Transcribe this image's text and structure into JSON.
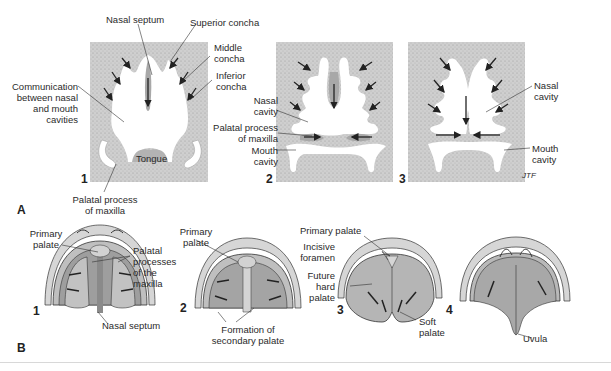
{
  "figure": {
    "part_a": {
      "label": "A",
      "panels": [
        {
          "number": "1",
          "labels": {
            "nasal_septum": "Nasal septum",
            "superior_concha": "Superior concha",
            "middle_concha_1": "Middle",
            "middle_concha_2": "concha",
            "inferior_concha_1": "Inferior",
            "inferior_concha_2": "concha",
            "communication_1": "Communication",
            "communication_2": "between nasal",
            "communication_3": "and mouth",
            "communication_4": "cavities",
            "tongue": "Tongue",
            "palatal_process_1": "Palatal process",
            "palatal_process_2": "of maxilla"
          }
        },
        {
          "number": "2",
          "labels": {
            "nasal_cavity_1": "Nasal",
            "nasal_cavity_2": "cavity",
            "palatal_process_1": "Palatal process",
            "palatal_process_2": "of maxilla",
            "mouth_cavity_1": "Mouth",
            "mouth_cavity_2": "cavity"
          }
        },
        {
          "number": "3",
          "labels": {
            "nasal_cavity_1": "Nasal",
            "nasal_cavity_2": "cavity",
            "mouth_cavity_1": "Mouth",
            "mouth_cavity_2": "cavity",
            "signature": "JTF"
          }
        }
      ]
    },
    "part_b": {
      "label": "B",
      "panels": [
        {
          "number": "1",
          "labels": {
            "primary_palate_1": "Primary",
            "primary_palate_2": "palate",
            "palatal_processes_1": "Palatal",
            "palatal_processes_2": "processes",
            "palatal_processes_3": "of the",
            "palatal_processes_4": "maxilla",
            "nasal_septum": "Nasal septum"
          }
        },
        {
          "number": "2",
          "labels": {
            "primary_palate_1": "Primary",
            "primary_palate_2": "palate",
            "formation_1": "Formation of",
            "formation_2": "secondary palate"
          }
        },
        {
          "number": "3",
          "labels": {
            "primary_palate": "Primary palate",
            "incisive_foramen_1": "Incisive",
            "incisive_foramen_2": "foramen",
            "future_hard_palate_1": "Future",
            "future_hard_palate_2": "hard",
            "future_hard_palate_3": "palate",
            "soft_palate_1": "Soft",
            "soft_palate_2": "palate"
          }
        },
        {
          "number": "4",
          "labels": {
            "uvula": "Uvula"
          }
        }
      ]
    },
    "colors": {
      "stipple_bg": "#c9c9c9",
      "tissue_dark": "#a8a8a8",
      "cavity": "#ffffff",
      "line": "#333333",
      "divider": "#d8d8d8"
    }
  }
}
